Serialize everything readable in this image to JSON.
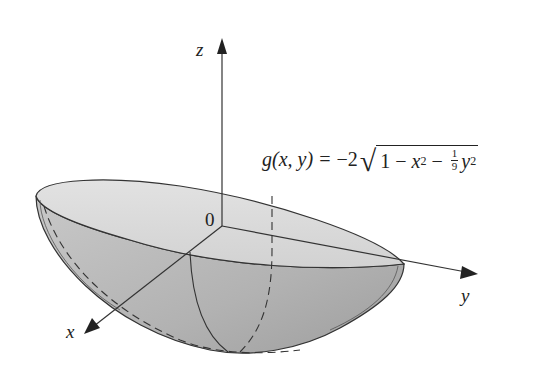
{
  "figure": {
    "type": "3d-surface-plot",
    "formula": {
      "lhs": "g(x, y) =",
      "coef": "−2",
      "radicand_prefix": "1 − ",
      "x_var": "x",
      "x_exp": "2",
      "minus": " − ",
      "frac_num": "1",
      "frac_den": "9",
      "y_var": "y",
      "y_exp": "2"
    },
    "axes": {
      "z_label": "z",
      "y_label": "y",
      "x_label": "x",
      "origin_label": "0"
    },
    "colors": {
      "surface_top": "#dedede",
      "surface_side": "#b4b4b4",
      "stroke": "#333333",
      "background": "#ffffff"
    }
  }
}
